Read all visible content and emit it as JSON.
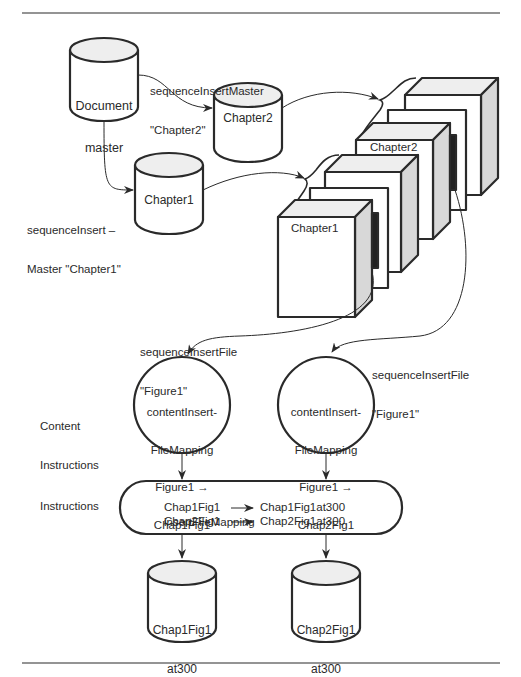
{
  "diagram": {
    "nodes": {
      "document_master": {
        "line1": "Document",
        "line2": "master"
      },
      "chapter2_db": {
        "label": "Chapter2"
      },
      "chapter1_db": {
        "label": "Chapter1"
      },
      "book_chapter2": {
        "label": "Chapter2"
      },
      "book_chapter1": {
        "label": "Chapter1"
      },
      "content_instr_1": {
        "line1": "contentInsert-",
        "line2": "FileMapping",
        "line3": "Figure1 →",
        "line4": "Chap1Fig1"
      },
      "content_instr_2": {
        "line1": "contentInsert-",
        "line2": "FileMapping",
        "line3": "Figure1 →",
        "line4": "Chap2Fig1"
      },
      "instructions": {
        "line1": "insertFileMapping",
        "row1_from": "Chap1Fig1",
        "row1_to": "Chap1Fig1at300",
        "row2_from": "Chap2Fig1",
        "row2_to": "Chap2Fig1at300"
      },
      "output1": {
        "line1": "Chap1Fig1",
        "line2": "at300"
      },
      "output2": {
        "line1": "Chap2Fig1",
        "line2": "at300"
      }
    },
    "edge_labels": {
      "seq_master_ch2": {
        "line1": "sequenceInsertMaster",
        "line2": "\"Chapter2\""
      },
      "seq_master_ch1": {
        "line1": "sequenceInsert –",
        "line2": "Master \"Chapter1\""
      },
      "seq_file_1": {
        "line1": "sequenceInsertFile",
        "line2": "\"Figure1\""
      },
      "seq_file_2": {
        "line1": "sequenceInsertFile",
        "line2": "\"Figure1\""
      }
    },
    "row_labels": {
      "content_instructions": {
        "line1": "Content",
        "line2": "Instructions"
      },
      "instructions": "Instructions"
    },
    "colors": {
      "stroke": "#2a2a2a",
      "shade": "#d8d8d8",
      "dark": "#222222",
      "top": "#eeeeee"
    }
  }
}
